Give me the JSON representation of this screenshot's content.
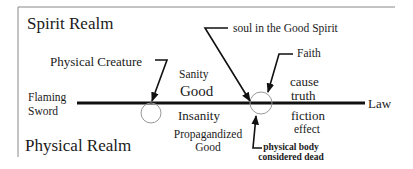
{
  "diagram": {
    "realms": {
      "spirit": "Spirit Realm",
      "physical": "Physical Realm"
    },
    "axis": {
      "left_label_line1": "Flaming",
      "left_label_line2": "Sword",
      "right_label": "Law"
    },
    "upper_labels": {
      "sanity": "Sanity",
      "good": "Good",
      "cause": "cause",
      "truth": "truth"
    },
    "lower_labels": {
      "insanity": "Insanity",
      "propagandized_line1": "Propagandized",
      "propagandized_line2": "Good",
      "fiction": "fiction",
      "effect": "effect"
    },
    "callouts": {
      "physical_creature": "Physical Creature",
      "soul": "soul in the Good Spirit",
      "faith": "Faith",
      "physical_body_line1": "physical body",
      "physical_body_line2": "considered dead"
    },
    "colors": {
      "line": "#111111",
      "border": "#888888",
      "circle": "#999999",
      "text": "#1a1a1a"
    }
  }
}
